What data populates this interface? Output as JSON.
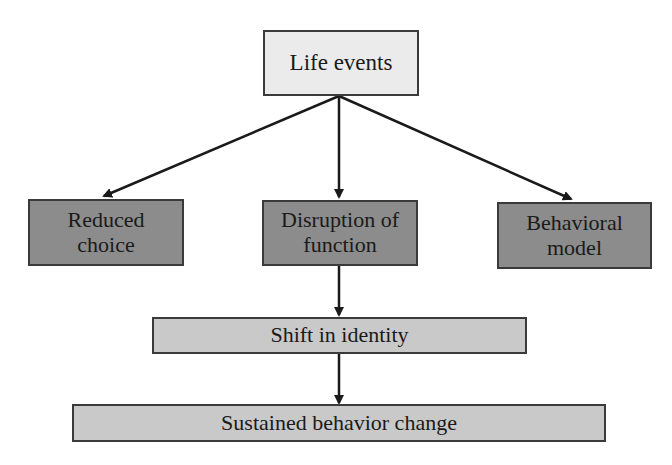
{
  "diagram": {
    "nodes": [
      {
        "id": "life-events",
        "label": "Life events",
        "level": 0
      },
      {
        "id": "reduced-choice",
        "label": "Reduced\nchoice",
        "line1": "Reduced",
        "line2": "choice",
        "level": 1
      },
      {
        "id": "disruption-of-function",
        "label": "Disruption of\nfunction",
        "line1": "Disruption of",
        "line2": "function",
        "level": 1
      },
      {
        "id": "behavioral-model",
        "label": "Behavioral\nmodel",
        "line1": "Behavioral",
        "line2": "model",
        "level": 1
      },
      {
        "id": "shift-in-identity",
        "label": "Shift in identity",
        "level": 2
      },
      {
        "id": "sustained-behavior-change",
        "label": "Sustained behavior change",
        "level": 3
      }
    ],
    "edges": [
      {
        "from": "life-events",
        "to": "reduced-choice"
      },
      {
        "from": "life-events",
        "to": "disruption-of-function"
      },
      {
        "from": "life-events",
        "to": "behavioral-model"
      },
      {
        "from": "disruption-of-function",
        "to": "shift-in-identity"
      },
      {
        "from": "shift-in-identity",
        "to": "sustained-behavior-change"
      }
    ],
    "colors": {
      "top_box": "#ebebeb",
      "middle_boxes": "#8c8c8c",
      "lower_boxes": "#c9c9c9",
      "border": "#3a3a3a",
      "arrow": "#1a1a1a"
    }
  }
}
